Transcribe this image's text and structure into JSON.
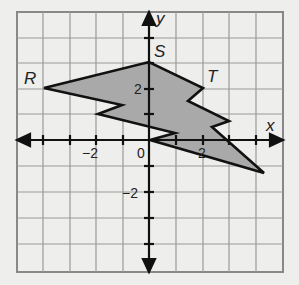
{
  "figure": {
    "type": "coordinate-plane",
    "grid": {
      "x_range": [
        -5,
        5
      ],
      "y_range": [
        -5,
        5
      ],
      "step": 1
    },
    "axes": {
      "x_label": "x",
      "y_label": "y"
    },
    "tick_labels": {
      "x": [
        {
          "value": -2,
          "text": "−2"
        },
        {
          "value": 2,
          "text": "2"
        }
      ],
      "y": [
        {
          "value": 2,
          "text": "2"
        },
        {
          "value": -2,
          "text": "−2"
        }
      ],
      "origin": "0"
    },
    "points": [
      {
        "name": "R",
        "x": -4,
        "y": 2
      },
      {
        "name": "S",
        "x": 0,
        "y": 3
      },
      {
        "name": "T",
        "x": 2,
        "y": 2
      }
    ],
    "polygon": {
      "fill": "#a9a9a9",
      "stroke": "#111111",
      "vertices": [
        [
          -4,
          2
        ],
        [
          0,
          3
        ],
        [
          2,
          2
        ],
        [
          1.5,
          1.5
        ],
        [
          3,
          0.75
        ],
        [
          2.4,
          0.5
        ],
        [
          4.3,
          -1.25
        ],
        [
          0,
          0
        ],
        [
          1,
          0.25
        ],
        [
          -1.9,
          1
        ],
        [
          -1,
          1.3
        ]
      ]
    }
  }
}
